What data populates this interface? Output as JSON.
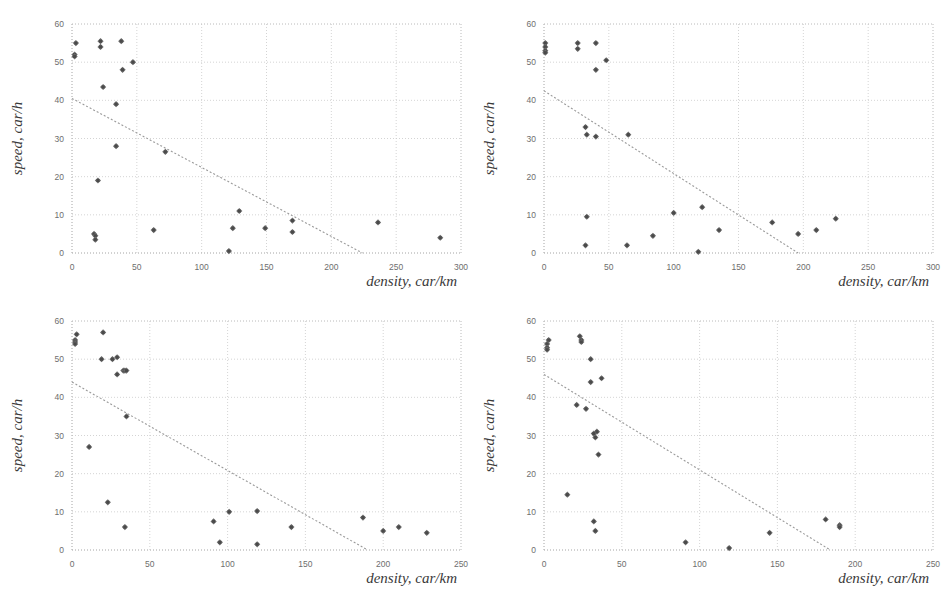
{
  "figure": {
    "panel_count": 4,
    "marker_color": "#6b6b6b",
    "grid_color": "#c9c9c9",
    "trend_color": "#9a9a9a"
  },
  "chart_data": [
    {
      "type": "scatter",
      "title": "",
      "panel": "top-left",
      "xlabel": "density, car/km",
      "ylabel": "speed, car/h",
      "xlim": [
        0,
        300
      ],
      "ylim": [
        0,
        60
      ],
      "xticks": [
        0,
        50,
        100,
        150,
        200,
        250,
        300
      ],
      "yticks": [
        0,
        10,
        20,
        30,
        40,
        50,
        60
      ],
      "xticklabels": [
        "0",
        "50",
        "100",
        "150",
        "200",
        "250",
        "300"
      ],
      "yticklabels": [
        "0",
        "10",
        "20",
        "30",
        "40",
        "50",
        "60"
      ],
      "grid": true,
      "legend": "none",
      "points": [
        [
          3,
          55
        ],
        [
          2,
          52
        ],
        [
          2,
          51.5
        ],
        [
          22,
          55.5
        ],
        [
          22,
          54
        ],
        [
          38,
          55.5
        ],
        [
          47,
          50
        ],
        [
          39,
          48
        ],
        [
          24,
          43.5
        ],
        [
          34,
          39
        ],
        [
          34,
          28
        ],
        [
          72,
          26.5
        ],
        [
          20,
          19
        ],
        [
          17,
          5
        ],
        [
          18,
          4.5
        ],
        [
          18,
          3.5
        ],
        [
          63,
          6
        ],
        [
          124,
          6.5
        ],
        [
          129,
          11
        ],
        [
          121,
          0.5
        ],
        [
          149,
          6.5
        ],
        [
          170,
          8.5
        ],
        [
          170,
          5.5
        ],
        [
          236,
          8
        ],
        [
          284,
          4
        ]
      ],
      "trend": {
        "x0": 0,
        "y0": 40.5,
        "x1": 224,
        "y1": 0
      }
    },
    {
      "type": "scatter",
      "title": "",
      "panel": "top-right",
      "xlabel": "density, car/km",
      "ylabel": "speed, car/h",
      "xlim": [
        0,
        300
      ],
      "ylim": [
        0,
        60
      ],
      "xticks": [
        0,
        50,
        100,
        150,
        200,
        250,
        300
      ],
      "yticks": [
        0,
        10,
        20,
        30,
        40,
        50,
        60
      ],
      "xticklabels": [
        "0",
        "50",
        "100",
        "150",
        "200",
        "250",
        "300"
      ],
      "yticklabels": [
        "0",
        "10",
        "20",
        "30",
        "40",
        "50",
        "60"
      ],
      "grid": true,
      "legend": "none",
      "points": [
        [
          1,
          55
        ],
        [
          1,
          54
        ],
        [
          1,
          53
        ],
        [
          1,
          52.5
        ],
        [
          26,
          55
        ],
        [
          26,
          53.5
        ],
        [
          40,
          55
        ],
        [
          48,
          50.5
        ],
        [
          40,
          48
        ],
        [
          32,
          33
        ],
        [
          33,
          31
        ],
        [
          40,
          30.5
        ],
        [
          65,
          31
        ],
        [
          33,
          9.5
        ],
        [
          100,
          10.5
        ],
        [
          122,
          12
        ],
        [
          32,
          2
        ],
        [
          64,
          2
        ],
        [
          84,
          4.5
        ],
        [
          119,
          0.3
        ],
        [
          135,
          6
        ],
        [
          176,
          8
        ],
        [
          196,
          5
        ],
        [
          210,
          6
        ],
        [
          225,
          9
        ]
      ],
      "trend": {
        "x0": 0,
        "y0": 42.5,
        "x1": 196,
        "y1": 0
      }
    },
    {
      "type": "scatter",
      "title": "",
      "panel": "bottom-left",
      "xlabel": "density, car/km",
      "ylabel": "speed, car/h",
      "xlim": [
        0,
        250
      ],
      "ylim": [
        0,
        60
      ],
      "xticks": [
        0,
        50,
        100,
        150,
        200,
        250
      ],
      "yticks": [
        0,
        10,
        20,
        30,
        40,
        50,
        60
      ],
      "xticklabels": [
        "0",
        "50",
        "100",
        "150",
        "200",
        "250"
      ],
      "yticklabels": [
        "0",
        "10",
        "20",
        "30",
        "40",
        "50",
        "60"
      ],
      "grid": true,
      "legend": "none",
      "points": [
        [
          3,
          56.5
        ],
        [
          2,
          55
        ],
        [
          2,
          54.5
        ],
        [
          2,
          54
        ],
        [
          20,
          57
        ],
        [
          19,
          50
        ],
        [
          29,
          50.5
        ],
        [
          26,
          50
        ],
        [
          33,
          47
        ],
        [
          29,
          46
        ],
        [
          34,
          47
        ],
        [
          35,
          47
        ],
        [
          35,
          35
        ],
        [
          11,
          27
        ],
        [
          23,
          12.5
        ],
        [
          34,
          6
        ],
        [
          91,
          7.5
        ],
        [
          101,
          10
        ],
        [
          119,
          10.2
        ],
        [
          95,
          2
        ],
        [
          119,
          1.5
        ],
        [
          141,
          6
        ],
        [
          187,
          8.5
        ],
        [
          200,
          5
        ],
        [
          210,
          6
        ],
        [
          228,
          4.5
        ]
      ],
      "trend": {
        "x0": 0,
        "y0": 44,
        "x1": 190,
        "y1": 0
      }
    },
    {
      "type": "scatter",
      "title": "",
      "panel": "bottom-right",
      "xlabel": "density, car/km",
      "ylabel": "speed, car/h",
      "xlim": [
        0,
        250
      ],
      "ylim": [
        0,
        60
      ],
      "xticks": [
        0,
        50,
        100,
        150,
        200,
        250
      ],
      "yticks": [
        0,
        10,
        20,
        30,
        40,
        50,
        60
      ],
      "xticklabels": [
        "0",
        "50",
        "100",
        "150",
        "200",
        "250"
      ],
      "yticklabels": [
        "0",
        "10",
        "20",
        "30",
        "40",
        "50",
        "60"
      ],
      "grid": true,
      "legend": "none",
      "points": [
        [
          2,
          54
        ],
        [
          3,
          55
        ],
        [
          2,
          53
        ],
        [
          2,
          52.5
        ],
        [
          23,
          56
        ],
        [
          24,
          55
        ],
        [
          24,
          54.5
        ],
        [
          30,
          50
        ],
        [
          30,
          44
        ],
        [
          37,
          45
        ],
        [
          21,
          38
        ],
        [
          27,
          37
        ],
        [
          34,
          31
        ],
        [
          33,
          29.5
        ],
        [
          32,
          30.5
        ],
        [
          35,
          25
        ],
        [
          15,
          14.5
        ],
        [
          32,
          7.5
        ],
        [
          33,
          5
        ],
        [
          91,
          2
        ],
        [
          119,
          0.5
        ],
        [
          145,
          4.5
        ],
        [
          181,
          8
        ],
        [
          190,
          6.5
        ],
        [
          190,
          6
        ]
      ],
      "trend": {
        "x0": 0,
        "y0": 46,
        "x1": 184,
        "y1": 0
      }
    }
  ]
}
